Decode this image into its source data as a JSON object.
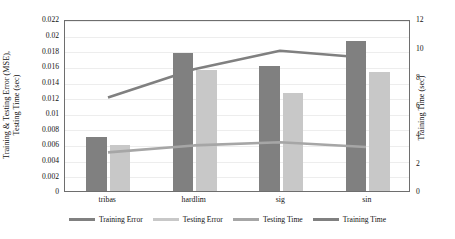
{
  "chart_data": {
    "type": "bar",
    "title": "",
    "subtitle": "",
    "categories": [
      "tribas",
      "hardlim",
      "sig",
      "sin"
    ],
    "xlabel": "",
    "ylabel": "Training & Testing Error (MSE), Testing Time (sec)",
    "ylabel_right": "Training Time (sec)",
    "ylim": [
      0,
      0.022
    ],
    "ylim_right": [
      0,
      12
    ],
    "yticks": [
      "0",
      "0.002",
      "0.004",
      "0.006",
      "0.008",
      "0.01",
      "0.012",
      "0.014",
      "0.016",
      "0.018",
      "0.02",
      "0.022"
    ],
    "ytick_values": [
      0,
      0.002,
      0.004,
      0.006,
      0.008,
      0.01,
      0.012,
      0.014,
      0.016,
      0.018,
      0.02,
      0.022
    ],
    "yticks_right": [
      "0",
      "2",
      "4",
      "6",
      "8",
      "10",
      "12"
    ],
    "ytick_values_right": [
      0,
      2,
      4,
      6,
      8,
      10,
      12
    ],
    "grid": true,
    "legend_position": "bottom",
    "series": [
      {
        "name": "Training Error",
        "type": "bar",
        "axis": "left",
        "color": "#808080",
        "values": [
          0.0069,
          0.0177,
          0.016,
          0.0192
        ]
      },
      {
        "name": "Testing Error",
        "type": "bar",
        "axis": "left",
        "color": "#c8c8c8",
        "values": [
          0.0059,
          0.0155,
          0.0125,
          0.0152
        ]
      },
      {
        "name": "Testing Time",
        "type": "line",
        "axis": "left",
        "color": "#a6a6a6",
        "values": [
          0.005,
          0.0059,
          0.0063,
          0.0057
        ]
      },
      {
        "name": "Training Time",
        "type": "line",
        "axis": "right",
        "color": "#808080",
        "values": [
          6.6,
          8.6,
          9.9,
          9.4
        ]
      }
    ]
  },
  "legend": {
    "items": [
      {
        "label": "Training Error",
        "color": "#808080"
      },
      {
        "label": "Testing Error",
        "color": "#c8c8c8"
      },
      {
        "label": "Testing Time",
        "color": "#a6a6a6"
      },
      {
        "label": "Training Time",
        "color": "#808080"
      }
    ]
  },
  "axes": {
    "left_title_line1": "Training & Testing Error (MSE),",
    "left_title_line2": "Testing Time (sec)",
    "right_title": "Training Time (sec)"
  }
}
